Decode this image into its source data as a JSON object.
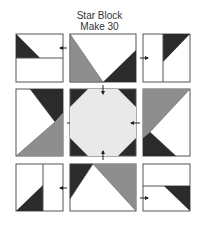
{
  "title": {
    "line1": "Star Block",
    "line2": "Make 30"
  },
  "colors": {
    "dark": "#2b2b2b",
    "medium": "#8e8e8e",
    "light": "#e9e9e9",
    "white": "#ffffff",
    "outline": "#555555"
  },
  "units": [
    {
      "position": "top-left",
      "description": "two rectangles stacked; top rectangle with dark triangle at left",
      "arrow": "pointing left toward center"
    },
    {
      "position": "top-center",
      "description": "flying geese unit: medium triangle left, dark triangle right, white top",
      "arrow": "none"
    },
    {
      "position": "top-right",
      "description": "two rectangles side by side; right rectangle with dark triangle at top",
      "arrow": "pointing right"
    },
    {
      "position": "middle-left",
      "description": "white left, dark top-right triangle, medium bottom triangle",
      "arrow": "pointing right into center"
    },
    {
      "position": "center",
      "description": "light octagon with dark corner triangles",
      "arrow": "arrows pressed on all four sides"
    },
    {
      "position": "middle-right",
      "description": "medium top triangle, dark bottom-left triangle, white right",
      "arrow": "none"
    },
    {
      "position": "bottom-left",
      "description": "two rectangles side by side; left rectangle with dark triangle at bottom",
      "arrow": "pointing left"
    },
    {
      "position": "bottom-center",
      "description": "dark triangle top-left, medium triangle top-right, white bottom",
      "arrow": "none"
    },
    {
      "position": "bottom-right",
      "description": "two rectangles stacked; bottom rectangle with dark triangle at right",
      "arrow": "pointing right"
    }
  ]
}
